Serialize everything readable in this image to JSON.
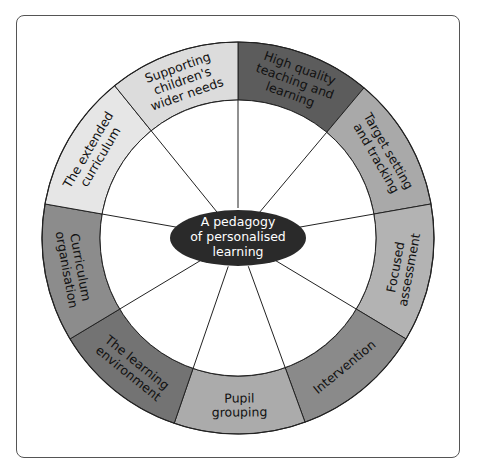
{
  "diagram": {
    "type": "wheel",
    "center_label": [
      "A pedagogy",
      "of personalised",
      "learning"
    ],
    "colors": {
      "hub": "#2a2a2a",
      "stroke": "#222222",
      "frame": "#555555"
    },
    "segments": [
      {
        "id": "high-quality-teaching",
        "lines": [
          "High quality",
          "teaching and",
          "learning"
        ],
        "start": 0,
        "end": 40,
        "fill": "#5c5c5c"
      },
      {
        "id": "target-setting",
        "lines": [
          "Target setting",
          "and tracking"
        ],
        "start": 40,
        "end": 80,
        "fill": "#a9a9a9"
      },
      {
        "id": "focused-assessment",
        "lines": [
          "Focused",
          "assessment"
        ],
        "start": 80,
        "end": 121,
        "fill": "#b3b3b3"
      },
      {
        "id": "intervention",
        "lines": [
          "Intervention"
        ],
        "start": 121,
        "end": 160,
        "fill": "#8a8a8a"
      },
      {
        "id": "pupil-grouping",
        "lines": [
          "Pupil",
          "grouping"
        ],
        "start": 160,
        "end": 199,
        "fill": "#ababab"
      },
      {
        "id": "learning-environment",
        "lines": [
          "The learning",
          "environment"
        ],
        "start": 199,
        "end": 239,
        "fill": "#737373"
      },
      {
        "id": "curriculum-organisation",
        "lines": [
          "Curriculum",
          "organisation"
        ],
        "start": 239,
        "end": 280,
        "fill": "#8c8c8c"
      },
      {
        "id": "extended-curriculum",
        "lines": [
          "The extended",
          "curriculum"
        ],
        "start": 280,
        "end": 321,
        "fill": "#e6e6e6"
      },
      {
        "id": "supporting-wider-needs",
        "lines": [
          "Supporting",
          "children's",
          "wider needs"
        ],
        "start": 321,
        "end": 360,
        "fill": "#dcdcdc"
      }
    ],
    "spokes": [
      {
        "angle": 0
      },
      {
        "angle": 40
      },
      {
        "angle": 80
      },
      {
        "angle": 121
      },
      {
        "angle": 160
      },
      {
        "angle": 199
      },
      {
        "angle": 239
      },
      {
        "angle": 280
      },
      {
        "angle": 321
      }
    ]
  }
}
